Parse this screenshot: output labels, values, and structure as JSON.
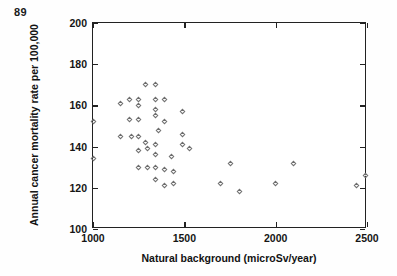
{
  "folio": "89",
  "figure": {
    "page_number": "89",
    "marker_color": "#6e6e6e",
    "axis_color": "#222222"
  },
  "chart_data": {
    "type": "scatter",
    "title": "",
    "xlabel": "Natural background (microSv/year)",
    "ylabel": "Annual cancer mortality rate per 100,000",
    "xlim": [
      1000,
      2500
    ],
    "ylim": [
      100,
      200
    ],
    "xticks": [
      1000,
      1500,
      2000,
      2500
    ],
    "yticks": [
      100,
      120,
      140,
      160,
      180,
      200
    ],
    "grid": false,
    "legend": null,
    "marker": "open-diamond",
    "series": [
      {
        "name": "prefecture observations",
        "points": [
          [
            1000,
            152
          ],
          [
            1000,
            134
          ],
          [
            1150,
            161
          ],
          [
            1150,
            145
          ],
          [
            1200,
            163
          ],
          [
            1200,
            153
          ],
          [
            1210,
            145
          ],
          [
            1250,
            163
          ],
          [
            1250,
            160
          ],
          [
            1250,
            153
          ],
          [
            1250,
            145
          ],
          [
            1250,
            138
          ],
          [
            1250,
            130
          ],
          [
            1290,
            170
          ],
          [
            1290,
            142
          ],
          [
            1300,
            139
          ],
          [
            1300,
            130
          ],
          [
            1340,
            170
          ],
          [
            1340,
            163
          ],
          [
            1340,
            158
          ],
          [
            1340,
            155
          ],
          [
            1340,
            141
          ],
          [
            1340,
            136
          ],
          [
            1340,
            130
          ],
          [
            1340,
            124
          ],
          [
            1360,
            148
          ],
          [
            1390,
            163
          ],
          [
            1390,
            152
          ],
          [
            1390,
            129
          ],
          [
            1390,
            121
          ],
          [
            1430,
            135
          ],
          [
            1440,
            128
          ],
          [
            1440,
            122
          ],
          [
            1490,
            157
          ],
          [
            1490,
            146
          ],
          [
            1490,
            141
          ],
          [
            1530,
            139
          ],
          [
            1700,
            122
          ],
          [
            1750,
            132
          ],
          [
            1800,
            118
          ],
          [
            2000,
            122
          ],
          [
            2100,
            132
          ],
          [
            2440,
            121
          ],
          [
            2490,
            126
          ]
        ]
      }
    ]
  }
}
